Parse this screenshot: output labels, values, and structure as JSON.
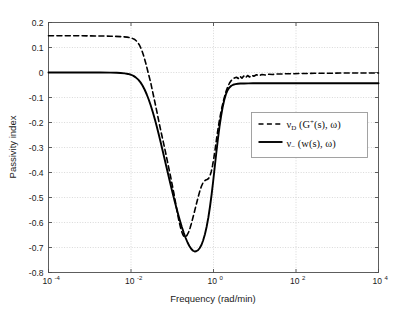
{
  "chart_data": {
    "type": "line",
    "title": "",
    "xlabel": "Frequency (rad/min)",
    "ylabel": "Passivity index",
    "xscale": "log",
    "xlim": [
      0.0001,
      10000
    ],
    "ylim": [
      -0.8,
      0.2
    ],
    "grid": true,
    "legend_position": "center-right",
    "xticks": [
      {
        "value": 0.0001,
        "base": "10",
        "exp": "-4"
      },
      {
        "value": 0.01,
        "base": "10",
        "exp": "-2"
      },
      {
        "value": 1,
        "base": "10",
        "exp": "0"
      },
      {
        "value": 100,
        "base": "10",
        "exp": "2"
      },
      {
        "value": 10000,
        "base": "10",
        "exp": "4"
      }
    ],
    "yticks": [
      "0.2",
      "0.1",
      "0",
      "-0.1",
      "-0.2",
      "-0.3",
      "-0.4",
      "-0.5",
      "-0.6",
      "-0.7",
      "-0.8"
    ],
    "ytick_values": [
      0.2,
      0.1,
      0,
      -0.1,
      -0.2,
      -0.3,
      -0.4,
      -0.5,
      -0.6,
      -0.7,
      -0.8
    ],
    "series": [
      {
        "name": "nu_D_dashed",
        "legend_parts": {
          "nu": "ν",
          "sub": "D",
          "open": " (",
          "G": "G",
          "sup": "+",
          "arg": "(s),",
          "omega": "ω",
          "close": ")"
        },
        "style": "dashed",
        "color": "#000000",
        "width": 1.6,
        "points": [
          [
            0.0001,
            0.147
          ],
          [
            0.00018,
            0.147
          ],
          [
            0.00032,
            0.147
          ],
          [
            0.00056,
            0.1468
          ],
          [
            0.001,
            0.1465
          ],
          [
            0.0018,
            0.146
          ],
          [
            0.0032,
            0.1452
          ],
          [
            0.0056,
            0.1435
          ],
          [
            0.008,
            0.1415
          ],
          [
            0.01,
            0.1385
          ],
          [
            0.012,
            0.1335
          ],
          [
            0.014,
            0.124
          ],
          [
            0.016,
            0.11
          ],
          [
            0.018,
            0.092
          ],
          [
            0.02,
            0.07
          ],
          [
            0.023,
            0.035
          ],
          [
            0.026,
            0.0
          ],
          [
            0.03,
            -0.04
          ],
          [
            0.034,
            -0.082
          ],
          [
            0.039,
            -0.128
          ],
          [
            0.045,
            -0.178
          ],
          [
            0.05,
            -0.215
          ],
          [
            0.057,
            -0.258
          ],
          [
            0.065,
            -0.3
          ],
          [
            0.072,
            -0.335
          ],
          [
            0.08,
            -0.372
          ],
          [
            0.09,
            -0.412
          ],
          [
            0.1,
            -0.45
          ],
          [
            0.11,
            -0.485
          ],
          [
            0.12,
            -0.52
          ],
          [
            0.13,
            -0.552
          ],
          [
            0.14,
            -0.58
          ],
          [
            0.15,
            -0.603
          ],
          [
            0.16,
            -0.622
          ],
          [
            0.17,
            -0.637
          ],
          [
            0.18,
            -0.648
          ],
          [
            0.19,
            -0.655
          ],
          [
            0.2,
            -0.658
          ],
          [
            0.215,
            -0.657
          ],
          [
            0.23,
            -0.65
          ],
          [
            0.25,
            -0.638
          ],
          [
            0.27,
            -0.622
          ],
          [
            0.29,
            -0.605
          ],
          [
            0.32,
            -0.578
          ],
          [
            0.35,
            -0.553
          ],
          [
            0.39,
            -0.522
          ],
          [
            0.43,
            -0.495
          ],
          [
            0.47,
            -0.472
          ],
          [
            0.51,
            -0.455
          ],
          [
            0.55,
            -0.443
          ],
          [
            0.6,
            -0.434
          ],
          [
            0.65,
            -0.43
          ],
          [
            0.7,
            -0.428
          ],
          [
            0.76,
            -0.424
          ],
          [
            0.82,
            -0.414
          ],
          [
            0.88,
            -0.397
          ],
          [
            0.95,
            -0.372
          ],
          [
            1.02,
            -0.342
          ],
          [
            1.1,
            -0.305
          ],
          [
            1.18,
            -0.268
          ],
          [
            1.27,
            -0.232
          ],
          [
            1.37,
            -0.198
          ],
          [
            1.48,
            -0.168
          ],
          [
            1.6,
            -0.14
          ],
          [
            1.75,
            -0.112
          ],
          [
            1.9,
            -0.09
          ],
          [
            2.05,
            -0.072
          ],
          [
            2.25,
            -0.055
          ],
          [
            2.45,
            -0.042
          ],
          [
            2.7,
            -0.032
          ],
          [
            2.95,
            -0.026
          ],
          [
            3.2,
            -0.022
          ],
          [
            3.6,
            -0.019
          ],
          [
            4.0,
            -0.024
          ],
          [
            4.4,
            -0.015
          ],
          [
            4.9,
            -0.023
          ],
          [
            5.4,
            -0.014
          ],
          [
            6.0,
            -0.021
          ],
          [
            6.7,
            -0.012
          ],
          [
            7.5,
            -0.018
          ],
          [
            8.5,
            -0.011
          ],
          [
            9.5,
            -0.015
          ],
          [
            11.0,
            -0.009
          ],
          [
            13.0,
            -0.012
          ],
          [
            15.0,
            -0.008
          ],
          [
            18.0,
            -0.01
          ],
          [
            22.0,
            -0.007
          ],
          [
            27.0,
            -0.008
          ],
          [
            34.0,
            -0.006
          ],
          [
            45.0,
            -0.006
          ],
          [
            60.0,
            -0.005
          ],
          [
            85.0,
            -0.005
          ],
          [
            120.0,
            -0.004
          ],
          [
            180.0,
            -0.004
          ],
          [
            280.0,
            -0.003
          ],
          [
            450.0,
            -0.003
          ],
          [
            700.0,
            -0.003
          ],
          [
            1200.0,
            -0.002
          ],
          [
            2000.0,
            -0.002
          ],
          [
            4000.0,
            -0.002
          ],
          [
            7000.0,
            -0.002
          ],
          [
            10000.0,
            -0.002
          ]
        ]
      },
      {
        "name": "nu_minus_solid",
        "legend_parts": {
          "nu": "ν",
          "sub": "−",
          "open": " (",
          "w": "w",
          "arg": "(s),",
          "omega": "ω",
          "close": ")"
        },
        "style": "solid",
        "color": "#000000",
        "width": 1.9,
        "points": [
          [
            0.0001,
            0.0
          ],
          [
            0.00032,
            0.0
          ],
          [
            0.001,
            0.0
          ],
          [
            0.0018,
            -0.0002
          ],
          [
            0.0032,
            -0.0006
          ],
          [
            0.0045,
            -0.0012
          ],
          [
            0.0056,
            -0.002
          ],
          [
            0.007,
            -0.0035
          ],
          [
            0.0085,
            -0.0058
          ],
          [
            0.01,
            -0.009
          ],
          [
            0.0115,
            -0.0135
          ],
          [
            0.013,
            -0.0195
          ],
          [
            0.015,
            -0.0285
          ],
          [
            0.017,
            -0.0395
          ],
          [
            0.019,
            -0.052
          ],
          [
            0.0215,
            -0.069
          ],
          [
            0.024,
            -0.087
          ],
          [
            0.027,
            -0.109
          ],
          [
            0.03,
            -0.131
          ],
          [
            0.034,
            -0.16
          ],
          [
            0.038,
            -0.188
          ],
          [
            0.042,
            -0.215
          ],
          [
            0.047,
            -0.247
          ],
          [
            0.052,
            -0.277
          ],
          [
            0.058,
            -0.31
          ],
          [
            0.064,
            -0.34
          ],
          [
            0.07,
            -0.368
          ],
          [
            0.078,
            -0.401
          ],
          [
            0.086,
            -0.431
          ],
          [
            0.095,
            -0.461
          ],
          [
            0.105,
            -0.49
          ],
          [
            0.115,
            -0.516
          ],
          [
            0.127,
            -0.543
          ],
          [
            0.14,
            -0.569
          ],
          [
            0.155,
            -0.595
          ],
          [
            0.17,
            -0.617
          ],
          [
            0.19,
            -0.641
          ],
          [
            0.21,
            -0.661
          ],
          [
            0.235,
            -0.68
          ],
          [
            0.26,
            -0.694
          ],
          [
            0.29,
            -0.706
          ],
          [
            0.32,
            -0.713
          ],
          [
            0.35,
            -0.716
          ],
          [
            0.38,
            -0.715
          ],
          [
            0.42,
            -0.711
          ],
          [
            0.46,
            -0.703
          ],
          [
            0.51,
            -0.69
          ],
          [
            0.56,
            -0.672
          ],
          [
            0.62,
            -0.647
          ],
          [
            0.68,
            -0.618
          ],
          [
            0.75,
            -0.58
          ],
          [
            0.82,
            -0.538
          ],
          [
            0.9,
            -0.488
          ],
          [
            0.98,
            -0.436
          ],
          [
            1.07,
            -0.379
          ],
          [
            1.17,
            -0.321
          ],
          [
            1.28,
            -0.266
          ],
          [
            1.4,
            -0.216
          ],
          [
            1.52,
            -0.176
          ],
          [
            1.66,
            -0.14
          ],
          [
            1.82,
            -0.11
          ],
          [
            2.0,
            -0.087
          ],
          [
            2.2,
            -0.071
          ],
          [
            2.4,
            -0.061
          ],
          [
            2.7,
            -0.053
          ],
          [
            3.0,
            -0.049
          ],
          [
            3.4,
            -0.0465
          ],
          [
            3.9,
            -0.045
          ],
          [
            4.5,
            -0.0443
          ],
          [
            5.5,
            -0.0438
          ],
          [
            7.0,
            -0.0435
          ],
          [
            9.0,
            -0.0433
          ],
          [
            12.0,
            -0.0432
          ],
          [
            18.0,
            -0.0431
          ],
          [
            30.0,
            -0.043
          ],
          [
            60.0,
            -0.043
          ],
          [
            150.0,
            -0.043
          ],
          [
            500.0,
            -0.043
          ],
          [
            2000.0,
            -0.043
          ],
          [
            10000.0,
            -0.043
          ]
        ]
      }
    ]
  },
  "legend": {
    "entries": [
      {
        "style": "dashed",
        "label": "ν_D (G+(s), ω)"
      },
      {
        "style": "solid",
        "label": "ν_− (w(s), ω)"
      }
    ]
  },
  "colors": {
    "axis": "#4d4d4d",
    "grid": "#c8c8c8",
    "curve": "#000000",
    "legend_border": "#999999",
    "background": "#ffffff"
  }
}
